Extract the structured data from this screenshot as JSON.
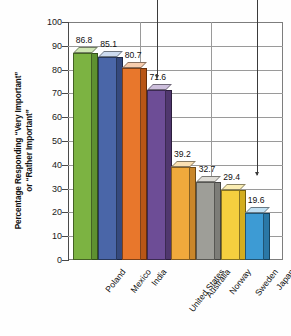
{
  "chart_data": {
    "type": "bar",
    "title": "",
    "xlabel": "",
    "ylabel": "Percentage Responding \"Very Important\" or \"Rather Important\"",
    "ylabel_line1": "Percentage Responding “Very Important”",
    "ylabel_line2": "or “Rather Important”",
    "categories": [
      "Poland",
      "Mexico",
      "India",
      "United States",
      "Australia",
      "Norway",
      "Sweden",
      "Japan"
    ],
    "values": [
      86.8,
      85.1,
      80.7,
      71.6,
      39.2,
      32.7,
      29.4,
      19.6
    ],
    "value_labels": [
      "86.8",
      "85.1",
      "80.7",
      "71.6",
      "39.2",
      "32.7",
      "29.4",
      "19.6"
    ],
    "colors": [
      "#7cb342",
      "#4a66a8",
      "#e8772c",
      "#6d4d96",
      "#f0a93c",
      "#9e9e98",
      "#f5cf3f",
      "#3d9bd4"
    ],
    "top_colors": [
      "#cfe6b4",
      "#cddbef",
      "#f7cdae",
      "#cdbfdc",
      "#fae0b4",
      "#dedcd6",
      "#fbeeb4",
      "#bfdff2"
    ],
    "side_colors": [
      "#5e9130",
      "#35497d",
      "#b85616",
      "#50376e",
      "#c9862a",
      "#7d7d78",
      "#d3ad1e",
      "#2a78a6"
    ],
    "ylim": [
      0,
      100
    ],
    "yticks": [
      100,
      90,
      80,
      70,
      60,
      50,
      40,
      30,
      20,
      10,
      0
    ],
    "ytick_labels": [
      "100",
      "90",
      "80",
      "70",
      "60",
      "50",
      "40",
      "30",
      "20",
      "10",
      "0"
    ],
    "grid": true,
    "legend": "none"
  },
  "annotations": [
    {
      "name": "leader-line-to-united-states",
      "target": "71.6"
    },
    {
      "name": "leader-line-to-sweden",
      "target": "29.4"
    }
  ]
}
